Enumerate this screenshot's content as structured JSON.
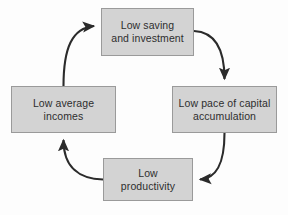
{
  "diagram": {
    "type": "cycle-flow-diagram",
    "direction": "clockwise",
    "colors": {
      "background": "#fdfdfd",
      "node_fill": "#d3d3d3",
      "node_border": "#9a9a9a",
      "arrow": "#2b2b2b",
      "text": "#2e2e2e"
    },
    "nodes": [
      {
        "id": "saving",
        "label": "Low saving\nand investment",
        "position": "top"
      },
      {
        "id": "capital",
        "label": "Low pace of capital\naccumulation",
        "position": "right"
      },
      {
        "id": "productivity",
        "label": "Low\nproductivity",
        "position": "bottom"
      },
      {
        "id": "incomes",
        "label": "Low average\nincomes",
        "position": "left"
      }
    ],
    "edges": [
      {
        "id": "edge-saving-to-capital",
        "from": "saving",
        "to": "capital",
        "arrowhead": "solid-triangle"
      },
      {
        "id": "edge-capital-to-productivity",
        "from": "capital",
        "to": "productivity",
        "arrowhead": "solid-triangle"
      },
      {
        "id": "edge-productivity-to-incomes",
        "from": "productivity",
        "to": "incomes",
        "arrowhead": "solid-triangle"
      },
      {
        "id": "edge-incomes-to-saving",
        "from": "incomes",
        "to": "saving",
        "arrowhead": "solid-triangle"
      }
    ]
  }
}
